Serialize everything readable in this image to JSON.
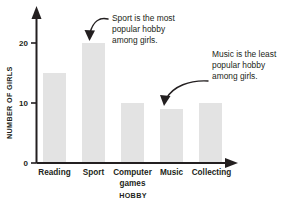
{
  "chart_data": {
    "type": "bar",
    "title": "",
    "subtitle": "",
    "xlabel": "HOBBY",
    "ylabel": "NUMBER OF GIRLS",
    "categories": [
      "Reading",
      "Sport",
      "Computer games",
      "Music",
      "Collecting"
    ],
    "values": [
      15,
      20,
      10,
      9,
      10
    ],
    "ylim": [
      0,
      22
    ],
    "yticks": [
      0,
      10,
      20
    ],
    "ytick_labels": [
      "0",
      "10",
      "20"
    ],
    "grid": false,
    "legend": false,
    "bar_color": "#e3e3e3",
    "axis_color": "#231f20",
    "annotations": [
      {
        "id": "sport-annotation",
        "lines": [
          "Sport is the most",
          "popular hobby",
          "among girls."
        ],
        "points_to": "Sport"
      },
      {
        "id": "music-annotation",
        "lines": [
          "Music is the least",
          "popular hobby",
          "among girls."
        ],
        "points_to": "Music"
      }
    ]
  },
  "axis": {
    "y_label": "NUMBER OF GIRLS",
    "x_label": "HOBBY",
    "ticks": {
      "t0": "0",
      "t10": "10",
      "t20": "20"
    }
  },
  "categories": {
    "c0": "Reading",
    "c1": "Sport",
    "c2_line1": "Computer",
    "c2_line2": "games",
    "c3": "Music",
    "c4": "Collecting"
  },
  "annotation_sport": {
    "line1": "Sport is the most",
    "line2": "popular hobby",
    "line3": "among girls."
  },
  "annotation_music": {
    "line1": "Music is the least",
    "line2": "popular hobby",
    "line3": "among girls."
  }
}
